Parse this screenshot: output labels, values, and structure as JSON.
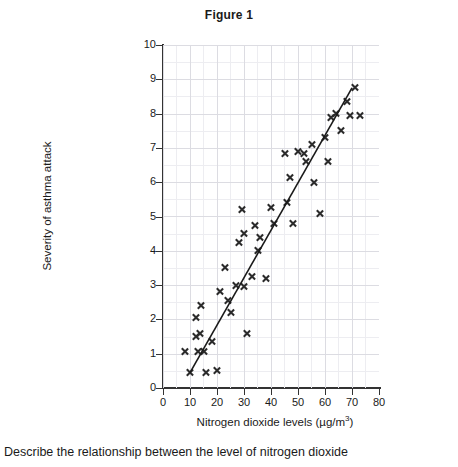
{
  "chart_data": {
    "type": "scatter",
    "title": "Figure 1",
    "xlabel_main": "Nitrogen dioxide levels (µg/m",
    "xlabel_sup": "3",
    "xlabel_tail": ")",
    "xlabel": "Nitrogen dioxide levels (µg/m3)",
    "ylabel": "Severity of asthma attack",
    "xlim": [
      0,
      80
    ],
    "ylim": [
      0,
      10
    ],
    "xticks": [
      0,
      10,
      20,
      30,
      40,
      50,
      60,
      70,
      80
    ],
    "yticks": [
      0,
      1,
      2,
      3,
      4,
      5,
      6,
      7,
      8,
      9,
      10
    ],
    "grid": true,
    "grid_major_color": "#dcdce2",
    "grid_minor_color": "#ededf1",
    "marker": "x",
    "marker_color": "#2b2b2b",
    "legend": null,
    "points": [
      [
        8,
        1.05
      ],
      [
        10,
        0.45
      ],
      [
        12,
        2.05
      ],
      [
        12,
        1.5
      ],
      [
        13,
        1.05
      ],
      [
        13.5,
        1.6
      ],
      [
        14,
        2.4
      ],
      [
        15,
        1.05
      ],
      [
        16,
        0.45
      ],
      [
        18,
        1.35
      ],
      [
        20,
        0.5
      ],
      [
        21,
        2.8
      ],
      [
        23,
        3.5
      ],
      [
        24,
        2.55
      ],
      [
        25,
        2.2
      ],
      [
        27,
        3.0
      ],
      [
        28,
        4.25
      ],
      [
        29,
        5.2
      ],
      [
        30,
        2.95
      ],
      [
        30,
        4.5
      ],
      [
        31,
        1.6
      ],
      [
        33,
        3.25
      ],
      [
        34,
        4.75
      ],
      [
        35,
        4.0
      ],
      [
        36,
        4.4
      ],
      [
        38,
        3.2
      ],
      [
        40,
        5.25
      ],
      [
        41,
        4.8
      ],
      [
        45,
        6.85
      ],
      [
        46,
        5.4
      ],
      [
        47,
        6.15
      ],
      [
        48,
        4.8
      ],
      [
        50,
        6.9
      ],
      [
        52,
        6.85
      ],
      [
        53,
        6.6
      ],
      [
        55,
        7.1
      ],
      [
        56,
        6.0
      ],
      [
        58,
        5.1
      ],
      [
        60,
        7.3
      ],
      [
        61,
        6.6
      ],
      [
        62,
        7.9
      ],
      [
        64,
        8.0
      ],
      [
        66,
        7.5
      ],
      [
        68,
        8.35
      ],
      [
        69,
        7.95
      ],
      [
        71,
        8.75
      ],
      [
        73,
        7.95
      ]
    ],
    "trend_line": {
      "label": "line of best fit",
      "x1": 10,
      "y1": 0.45,
      "x2": 70,
      "y2": 8.75,
      "color": "#1a1a1a"
    }
  },
  "caption": {
    "text": "Describe the relationship between the level of nitrogen dioxide"
  }
}
